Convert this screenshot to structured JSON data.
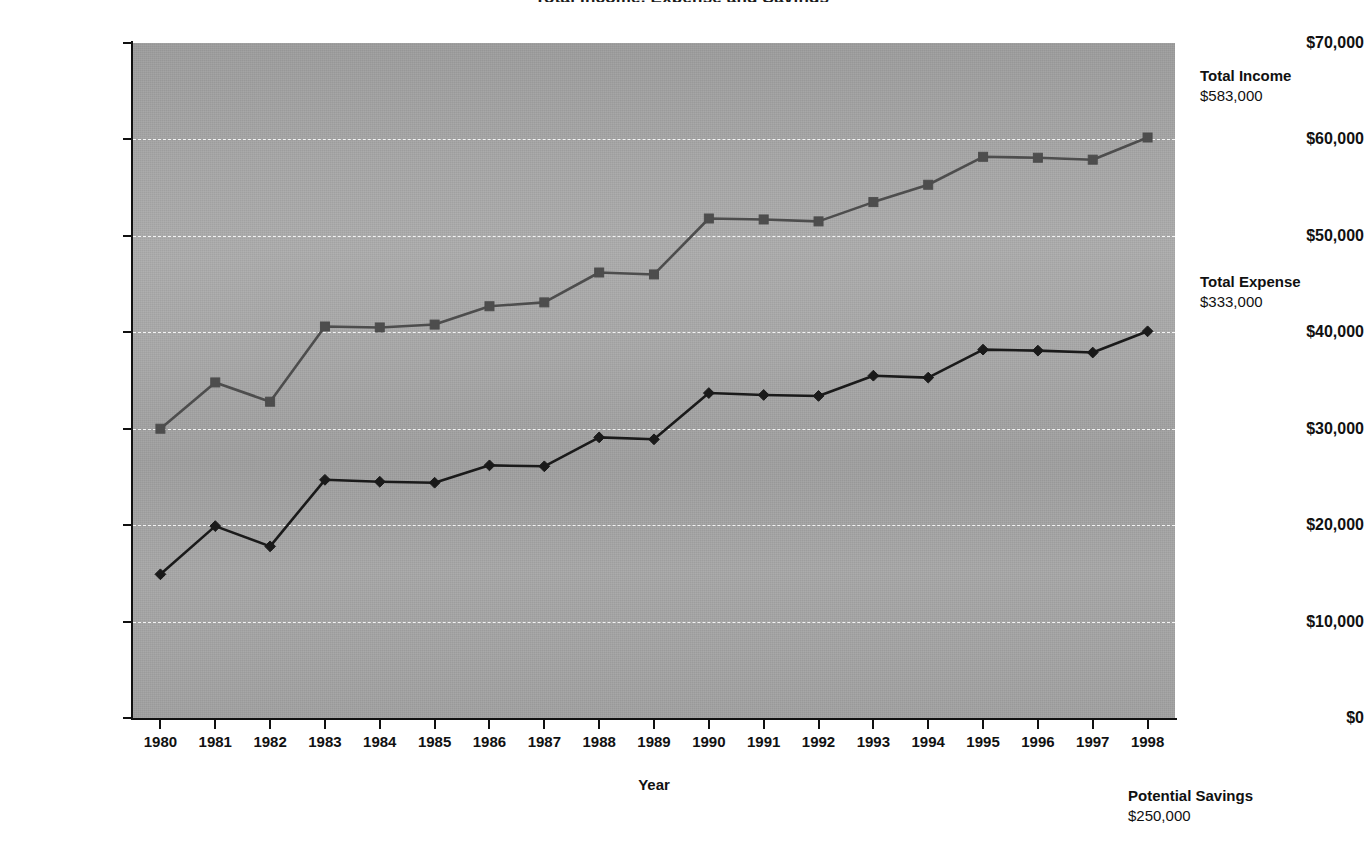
{
  "chart_data": {
    "type": "line",
    "title": "Total Income, Expense and Savings",
    "xlabel": "Year",
    "ylabel": "",
    "categories": [
      "1980",
      "1981",
      "1982",
      "1983",
      "1984",
      "1985",
      "1986",
      "1987",
      "1988",
      "1989",
      "1990",
      "1991",
      "1992",
      "1993",
      "1994",
      "1995",
      "1996",
      "1997",
      "1998"
    ],
    "ylim": [
      0,
      70000
    ],
    "ytick_values": [
      0,
      10000,
      20000,
      30000,
      40000,
      50000,
      60000,
      70000
    ],
    "ytick_labels": [
      "$0",
      "$10,000",
      "$20,000",
      "$30,000",
      "$40,000",
      "$50,000",
      "$60,000",
      "$70,000"
    ],
    "grid": true,
    "legend_position": "right-inline-annotations",
    "series": [
      {
        "name": "Total Income",
        "marker": "square",
        "color": "#4d4d4d",
        "values": [
          30000,
          34800,
          32800,
          40600,
          40500,
          40800,
          42700,
          43100,
          46200,
          46000,
          51800,
          51700,
          51500,
          53500,
          55300,
          58200,
          58100,
          57900,
          60200
        ]
      },
      {
        "name": "Total Expense",
        "marker": "diamond",
        "color": "#1a1a1a",
        "values": [
          14900,
          19900,
          17800,
          24700,
          24500,
          24400,
          26200,
          26100,
          29100,
          28900,
          33700,
          33500,
          33400,
          35500,
          35300,
          38200,
          38100,
          37900,
          40100
        ]
      }
    ],
    "annotations": [
      {
        "id": "total-income",
        "title": "Total Income",
        "value": "$583,000"
      },
      {
        "id": "total-expense",
        "title": "Total Expense",
        "value": "$333,000"
      },
      {
        "id": "potential-savings",
        "title": "Potential Savings",
        "value": "$250,000"
      }
    ]
  },
  "axes": {
    "y_labels": [
      "$70,000",
      "$60,000",
      "$50,000",
      "$40,000",
      "$30,000",
      "$20,000",
      "$10,000",
      "$0"
    ],
    "x_labels": [
      "1980",
      "1981",
      "1982",
      "1983",
      "1984",
      "1985",
      "1986",
      "1987",
      "1988",
      "1989",
      "1990",
      "1991",
      "1992",
      "1993",
      "1994",
      "1995",
      "1996",
      "1997",
      "1998"
    ],
    "x_title": "Year"
  },
  "annotations": {
    "income": {
      "title": "Total Income",
      "value": "$583,000"
    },
    "expense": {
      "title": "Total Expense",
      "value": "$333,000"
    },
    "savings": {
      "title": "Potential Savings",
      "value": "$250,000"
    }
  },
  "title": "Total Income, Expense and Savings",
  "colors": {
    "plot_background": "#a5a5a5",
    "gridline": "#ffffff",
    "income_series": "#4d4d4d",
    "expense_series": "#1a1a1a",
    "axis": "#111111"
  }
}
